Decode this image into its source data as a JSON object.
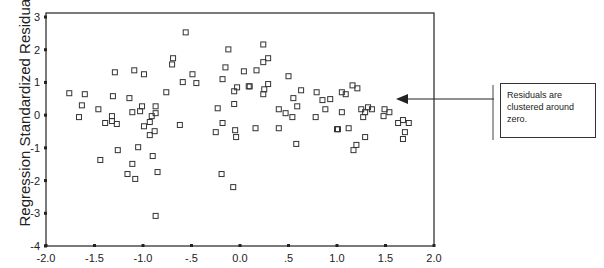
{
  "chart_data": {
    "type": "scatter",
    "title": "",
    "xlabel": "",
    "ylabel": "Regression Standardized Residual",
    "xlim": [
      -2.0,
      2.0
    ],
    "ylim": [
      -4,
      3
    ],
    "x_ticks": [
      "-2.0",
      "-1.5",
      "-1.0",
      "-.5",
      "0.0",
      ".5",
      "1.0",
      "1.5",
      "2.0"
    ],
    "y_ticks": [
      "3",
      "2",
      "1",
      "0",
      "-1",
      "-2",
      "-3",
      "-4"
    ],
    "grid": false,
    "marker": "hollow-square",
    "annotation": {
      "text": "Residuals are clustered around zero.",
      "arrow_target": {
        "x": 1.6,
        "y": 0.5
      }
    },
    "points": [
      [
        -1.76,
        0.67
      ],
      [
        -1.6,
        0.64
      ],
      [
        -1.29,
        1.31
      ],
      [
        -1.09,
        1.37
      ],
      [
        -0.99,
        1.25
      ],
      [
        -1.31,
        0.58
      ],
      [
        -1.14,
        0.52
      ],
      [
        -1.63,
        0.3
      ],
      [
        -1.46,
        0.18
      ],
      [
        -1.66,
        -0.06
      ],
      [
        -1.32,
        -0.03
      ],
      [
        -1.39,
        -0.24
      ],
      [
        -1.32,
        -0.18
      ],
      [
        -1.27,
        -0.27
      ],
      [
        -1.11,
        0.09
      ],
      [
        -1.03,
        0.12
      ],
      [
        -1.01,
        0.27
      ],
      [
        -0.87,
        0.27
      ],
      [
        -0.87,
        0.06
      ],
      [
        -0.91,
        -0.03
      ],
      [
        -0.93,
        -0.21
      ],
      [
        -0.99,
        -0.34
      ],
      [
        -0.93,
        -0.61
      ],
      [
        -0.88,
        -0.49
      ],
      [
        -1.26,
        -1.07
      ],
      [
        -1.05,
        -0.98
      ],
      [
        -1.44,
        -1.37
      ],
      [
        -1.11,
        -1.49
      ],
      [
        -0.9,
        -1.25
      ],
      [
        -0.85,
        -1.74
      ],
      [
        -1.16,
        -1.8
      ],
      [
        -1.08,
        -1.95
      ],
      [
        -0.87,
        -3.08
      ],
      [
        -0.56,
        2.53
      ],
      [
        -0.69,
        1.74
      ],
      [
        -0.7,
        1.55
      ],
      [
        -0.49,
        1.25
      ],
      [
        -0.59,
        1.01
      ],
      [
        -0.45,
        0.98
      ],
      [
        -0.76,
        0.7
      ],
      [
        -0.12,
        2.01
      ],
      [
        -0.15,
        1.46
      ],
      [
        0.04,
        1.34
      ],
      [
        -0.18,
        1.1
      ],
      [
        -0.03,
        0.85
      ],
      [
        -0.06,
        0.73
      ],
      [
        0.09,
        0.88
      ],
      [
        -0.62,
        -0.3
      ],
      [
        -0.23,
        0.21
      ],
      [
        -0.06,
        0.34
      ],
      [
        -0.18,
        -0.24
      ],
      [
        -0.25,
        -0.52
      ],
      [
        -0.05,
        -0.46
      ],
      [
        -0.04,
        -0.67
      ],
      [
        -0.19,
        -1.8
      ],
      [
        -0.07,
        -2.2
      ],
      [
        0.24,
        2.16
      ],
      [
        0.29,
        1.74
      ],
      [
        0.24,
        1.62
      ],
      [
        0.17,
        1.37
      ],
      [
        0.5,
        1.19
      ],
      [
        0.1,
        0.88
      ],
      [
        0.29,
        0.95
      ],
      [
        0.25,
        0.79
      ],
      [
        0.24,
        0.64
      ],
      [
        0.63,
        0.76
      ],
      [
        0.79,
        0.7
      ],
      [
        0.55,
        0.52
      ],
      [
        0.85,
        0.46
      ],
      [
        0.93,
        0.49
      ],
      [
        0.59,
        0.27
      ],
      [
        0.4,
        0.18
      ],
      [
        0.88,
        0.18
      ],
      [
        0.47,
        0.06
      ],
      [
        0.54,
        -0.06
      ],
      [
        0.78,
        -0.06
      ],
      [
        0.16,
        -0.4
      ],
      [
        0.4,
        -0.4
      ],
      [
        0.58,
        -0.88
      ],
      [
        1.0,
        -0.43
      ],
      [
        1.16,
        0.91
      ],
      [
        1.21,
        0.82
      ],
      [
        1.05,
        0.7
      ],
      [
        1.09,
        0.64
      ],
      [
        1.05,
        0.09
      ],
      [
        1.25,
        0.18
      ],
      [
        1.32,
        0.24
      ],
      [
        1.36,
        0.18
      ],
      [
        1.29,
        0.09
      ],
      [
        1.27,
        -0.06
      ],
      [
        1.49,
        0.18
      ],
      [
        1.54,
        0.09
      ],
      [
        1.48,
        -0.03
      ],
      [
        1.63,
        -0.24
      ],
      [
        1.68,
        -0.15
      ],
      [
        1.74,
        -0.24
      ],
      [
        1.7,
        -0.52
      ],
      [
        1.68,
        -0.73
      ],
      [
        1.01,
        -0.43
      ],
      [
        1.12,
        -0.4
      ],
      [
        1.29,
        -0.67
      ],
      [
        1.2,
        -0.91
      ],
      [
        1.17,
        -1.07
      ]
    ]
  },
  "callout": {
    "text": "Residuals are clustered around zero."
  }
}
